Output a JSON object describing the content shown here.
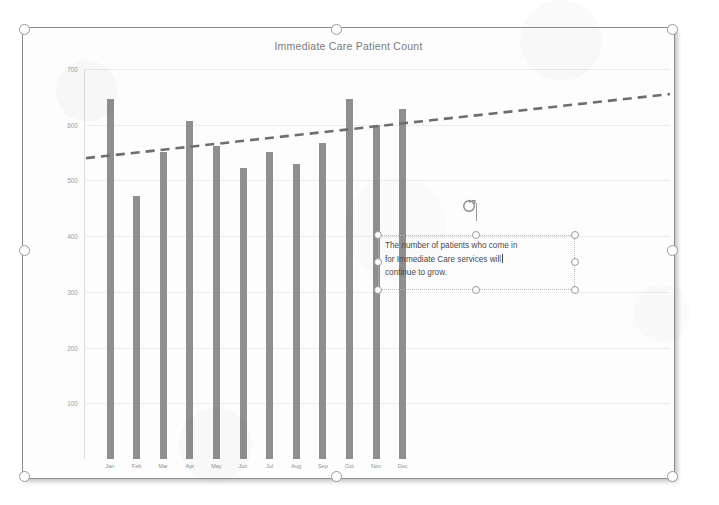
{
  "chart_data": {
    "type": "bar",
    "title": "Immediate Care Patient Count",
    "xlabel": "",
    "ylabel": "",
    "ylim": [
      0,
      700
    ],
    "yticks": [
      700,
      600,
      500,
      400,
      300,
      200,
      100
    ],
    "grid": true,
    "legend": "none",
    "categories": [
      "Jan",
      "Feb",
      "Mar",
      "Apr",
      "May",
      "Jun",
      "Jul",
      "Aug",
      "Sep",
      "Oct",
      "Nov",
      "Dec"
    ],
    "values": [
      647,
      472,
      551,
      607,
      562,
      522,
      551,
      530,
      567,
      647,
      600,
      629
    ],
    "series": [
      {
        "name": "Patient Count",
        "values": [
          647,
          472,
          551,
          607,
          562,
          522,
          551,
          530,
          567,
          647,
          600,
          629
        ]
      }
    ],
    "annotations": [
      {
        "type": "trendline",
        "style": "dashed",
        "extends_past_data": true,
        "start_value": 540,
        "end_value": 655
      }
    ],
    "colors": {
      "bar": "#8f8f8f",
      "trendline": "#6e6e6e",
      "gridline": "#ececec",
      "title_text": "#7b7b7b",
      "tick_text": "#9c9c9c"
    }
  },
  "chart": {
    "title": "Immediate Care Patient Count"
  },
  "textbox": {
    "line1": "The number of patients who come in",
    "line2": "for Immediate Care services will",
    "line3": "continue to grow.",
    "full_text": "The number of patients who come in for Immediate Care services will continue to grow."
  },
  "icons": {
    "rotate": "rotate-handle-icon"
  }
}
